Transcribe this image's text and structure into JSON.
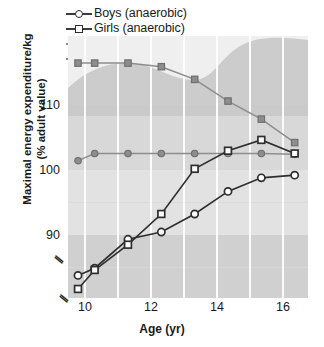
{
  "legend": {
    "items": [
      {
        "label": "Boys (anaerobic)",
        "marker": "open-circle",
        "icon": "open-circle-marker-icon"
      },
      {
        "label": "Girls (anaerobic)",
        "marker": "open-square",
        "icon": "open-square-marker-icon"
      },
      {
        "label": "Boys (aerobic)",
        "marker": "filled-circle",
        "icon": "filled-circle-marker-icon"
      },
      {
        "label": "Girls (aerobic)",
        "marker": "filled-square",
        "icon": "filled-square-marker-icon"
      }
    ]
  },
  "axes": {
    "y_title_line1": "Maximal energy expenditure/kg",
    "y_title_line2": "(% adult value)",
    "x_title": "Age (yr)",
    "y_ticks": [
      "110",
      "100",
      "90"
    ],
    "x_ticks": [
      "10",
      "12",
      "14",
      "16"
    ],
    "y_break_symbol": "//",
    "x_break_symbol": "//"
  },
  "colors": {
    "anaerobic_line": "#2e2e2e",
    "aerobic_line": "#8d8d8d",
    "open_marker_fill": "#ffffff",
    "filled_marker_fill": "#8d8d8d",
    "band_light": "#efefef",
    "band_mid": "#dedede",
    "band_dark": "#cfcfcf",
    "gridline": "#fdfdfd",
    "text": "#1a1a1a"
  },
  "chart_data": {
    "type": "line",
    "title": "",
    "xlabel": "Age (yr)",
    "ylabel": "Maximal energy expenditure/kg (% adult value)",
    "xlim": [
      9.2,
      16.4
    ],
    "ylim": [
      84,
      113
    ],
    "ytick_values": [
      110,
      100,
      90
    ],
    "xtick_values": [
      10,
      12,
      14,
      16
    ],
    "grid": "vertical-white-gridlines-and-horizontal-bands",
    "axis_break": {
      "y": true,
      "x": true,
      "note": "broken axis near origin"
    },
    "legend_position": "above-plot-left",
    "x": [
      9.5,
      10,
      11,
      12,
      13,
      14,
      15,
      16
    ],
    "series": [
      {
        "name": "Boys (anaerobic)",
        "marker": "open-circle",
        "values": [
          86.5,
          87.3,
          90.5,
          91.3,
          93.3,
          95.8,
          97.3,
          97.6
        ]
      },
      {
        "name": "Girls (anaerobic)",
        "marker": "open-square",
        "values": [
          85.0,
          87.1,
          89.9,
          93.3,
          98.3,
          100.3,
          101.5,
          100.0
        ]
      },
      {
        "name": "Boys (aerobic)",
        "marker": "filled-circle",
        "values": [
          99.2,
          100.0,
          100.0,
          100.0,
          100.0,
          100.0,
          100.0,
          99.9
        ]
      },
      {
        "name": "Girls (aerobic)",
        "marker": "filled-square",
        "values": [
          110.0,
          110.0,
          110.0,
          109.6,
          108.2,
          105.8,
          103.8,
          101.2
        ]
      }
    ]
  }
}
